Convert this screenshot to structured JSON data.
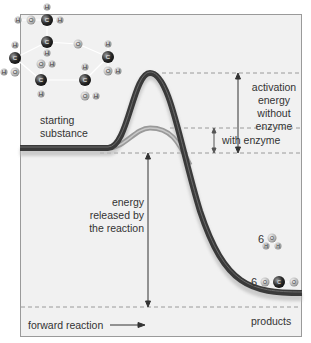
{
  "diagram": {
    "labels": {
      "starting_substance": [
        "starting",
        "substance"
      ],
      "activation_without": [
        "activation energy",
        "without enzyme"
      ],
      "with_enzyme": "with enzyme",
      "energy_released": [
        "energy",
        "released by",
        "the reaction"
      ],
      "products": "products",
      "forward_reaction": "forward reaction"
    },
    "product_molecules": [
      {
        "coefficient": "6",
        "formula": "H2O",
        "atoms": [
          "H",
          "O",
          "H"
        ]
      },
      {
        "coefficient": "6",
        "formula": "CO2",
        "atoms": [
          "O",
          "C",
          "O"
        ]
      }
    ],
    "reactant_molecule": {
      "name": "glucose",
      "atoms": [
        "H",
        "O",
        "C",
        "H",
        "H",
        "C",
        "O",
        "C",
        "H",
        "O",
        "H",
        "C",
        "O",
        "H",
        "C",
        "H",
        "O",
        "H",
        "C",
        "H",
        "O",
        "H"
      ]
    },
    "colors": {
      "frame_bg": "#f1f1f1",
      "curve_without_enzyme": "#3a3a3a",
      "curve_with_enzyme": "#8a8a8a",
      "dashed": "#9a9a9a",
      "text": "#333333"
    }
  }
}
